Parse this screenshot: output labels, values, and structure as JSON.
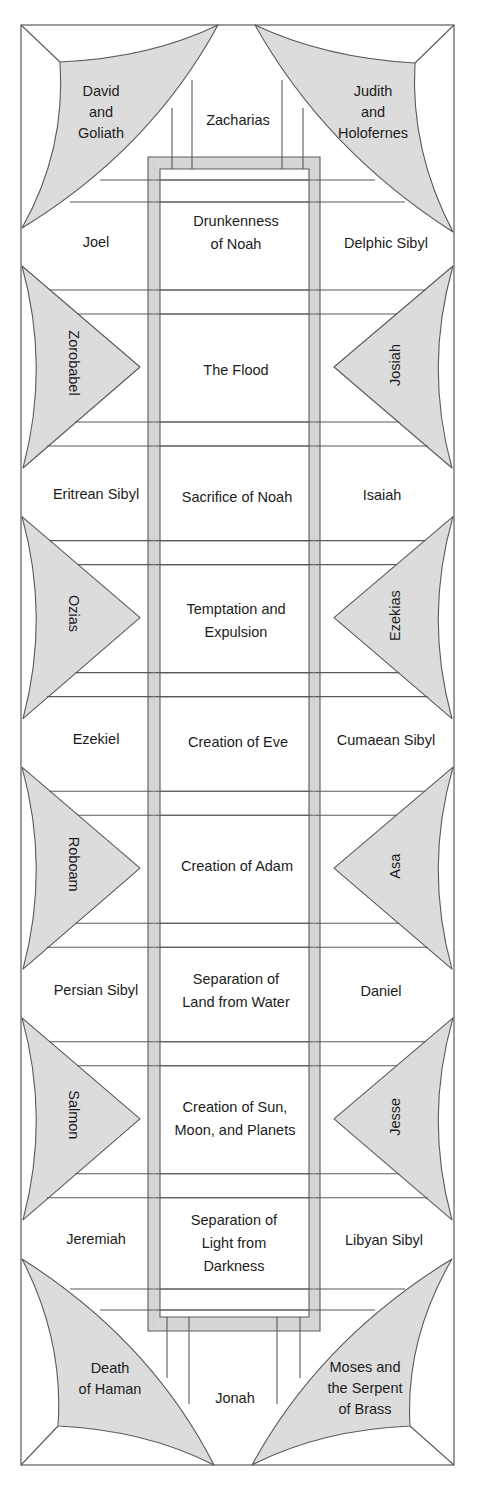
{
  "colors": {
    "line": "#5a5a5a",
    "fill": "#dcdcdc",
    "panel_border": "#d6d6d6",
    "text": "#1c1c1c",
    "background": "#ffffff"
  },
  "corners": {
    "top_left": {
      "lines": [
        "David",
        "and",
        "Goliath"
      ]
    },
    "top_right": {
      "lines": [
        "Judith",
        "and",
        "Holofernes"
      ]
    },
    "bottom_left": {
      "lines": [
        "Death",
        "of Haman"
      ]
    },
    "bottom_right": {
      "lines": [
        "Moses and",
        "the Serpent",
        "of Brass"
      ]
    }
  },
  "lunettes": {
    "top": "Zacharias",
    "bottom": "Jonah"
  },
  "center_panels": [
    {
      "lines": [
        "Drunkenness",
        "of Noah"
      ]
    },
    {
      "lines": [
        "The Flood"
      ]
    },
    {
      "lines": [
        "Sacrifice of Noah"
      ]
    },
    {
      "lines": [
        "Temptation and",
        "Expulsion"
      ]
    },
    {
      "lines": [
        "Creation of Eve"
      ]
    },
    {
      "lines": [
        "Creation of Adam"
      ]
    },
    {
      "lines": [
        "Separation of",
        "Land from Water"
      ]
    },
    {
      "lines": [
        "Creation of Sun,",
        "Moon, and Planets"
      ]
    },
    {
      "lines": [
        "Separation of",
        "Light from",
        "Darkness"
      ]
    }
  ],
  "seers_left": [
    "Joel",
    "Eritrean Sibyl",
    "Ezekiel",
    "Persian Sibyl",
    "Jeremiah"
  ],
  "seers_right": [
    "Delphic Sibyl",
    "Isaiah",
    "Cumaean Sibyl",
    "Daniel",
    "Libyan Sibyl"
  ],
  "spandrels_left": [
    "Zorobabel",
    "Ozias",
    "Roboam",
    "Salmon"
  ],
  "spandrels_right": [
    "Josiah",
    "Ezekias",
    "Asa",
    "Jesse"
  ]
}
